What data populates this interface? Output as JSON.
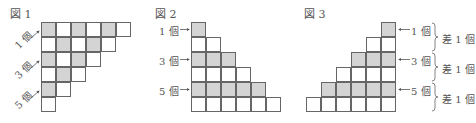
{
  "figures": [
    {
      "title": "図 1",
      "layout": "staircase-top-left",
      "rows": [
        {
          "cells": 6,
          "pattern": "checker-start-gray"
        },
        {
          "cells": 5,
          "pattern": "checker-start-white"
        },
        {
          "cells": 4,
          "pattern": "checker-start-gray"
        },
        {
          "cells": 3,
          "pattern": "checker-start-white"
        },
        {
          "cells": 2,
          "pattern": "checker-start-gray"
        },
        {
          "cells": 1,
          "pattern": "checker-start-white"
        }
      ],
      "labels": [
        "1 個",
        "3 個",
        "5 個"
      ]
    },
    {
      "title": "図 2",
      "layout": "staircase-left-aligned",
      "rows": [
        1,
        2,
        3,
        4,
        5,
        6
      ],
      "gray_rows": [
        1,
        3,
        5
      ],
      "labels": [
        "1 個",
        "3 個",
        "5 個"
      ]
    },
    {
      "title": "図 3",
      "layout": "staircase-right-aligned",
      "rows": [
        1,
        2,
        3,
        4,
        5,
        6
      ],
      "gray_rows": [
        1,
        3,
        5
      ],
      "labels": [
        "1 個",
        "3 個",
        "5 個"
      ],
      "differences": [
        "差 1 個",
        "差 1 個",
        "差 1 個"
      ]
    }
  ],
  "colors": {
    "gray_cell": "#d4d4d4",
    "border": "#666666"
  }
}
